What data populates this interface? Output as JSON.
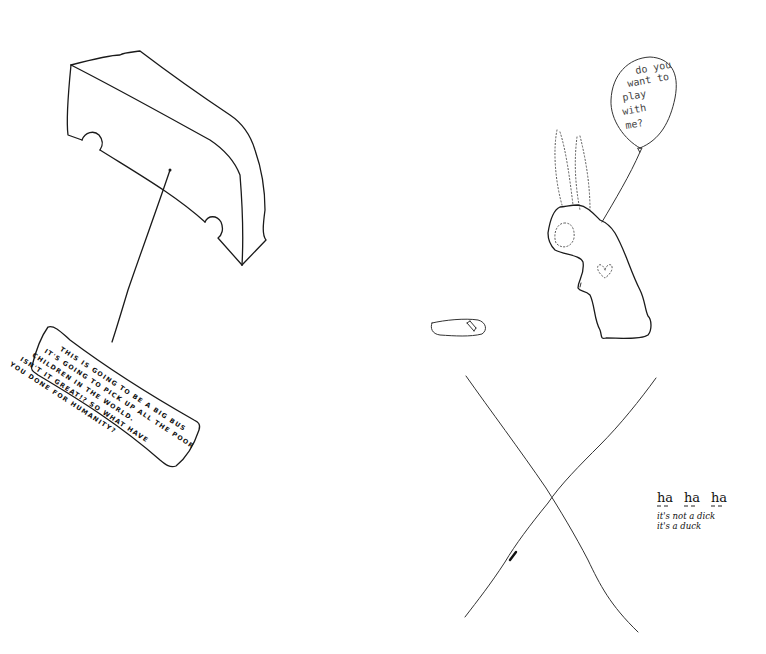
{
  "bus_drawing": {
    "label": "big bus"
  },
  "sign": {
    "lines": [
      "THIS IS GOING TO BE A BIG BUS",
      "IT'S GOING TO PICK UP ALL THE POOR",
      "CHILDREN IN THE WORLD.",
      "ISN'T IT GREAT!? SO WHAT HAVE",
      "YOU DONE FOR HUMANITY?"
    ]
  },
  "balloon": {
    "lines": [
      "do you",
      "want to",
      "play",
      "with",
      "me?"
    ]
  },
  "rabbit": {
    "label": "rabbit holding balloon"
  },
  "small_object": {
    "label": "small shoe"
  },
  "cross": {
    "label": "large X"
  },
  "duck_note": {
    "laugh": [
      "ha",
      "ha",
      "ha"
    ],
    "line1": "it's not a dick",
    "line2": "it's a duck"
  },
  "colors": {
    "ink": "#1a1a1a",
    "background": "#ffffff"
  }
}
